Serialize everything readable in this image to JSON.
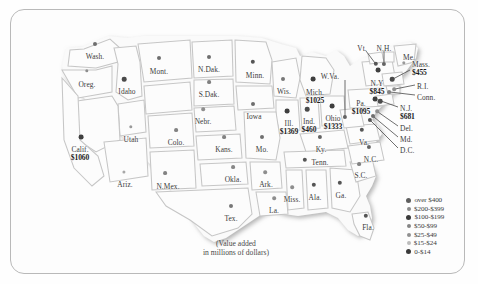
{
  "map": {
    "title": "Value added by manufacture, by state",
    "caption_line1": "(Value added",
    "caption_line2": "in millions of dollars)",
    "bg_color": "#fdfdfd",
    "frame_color": "#b9b9b9",
    "land_color": "#fbfbfb",
    "border_color": "#cfcfcf",
    "shadow_color": "#b3b3b3"
  },
  "states": [
    {
      "name": "Wash.",
      "value": "",
      "x": 95,
      "y": 53,
      "dx": 95,
      "dy": 44,
      "r": 2.0,
      "c": "#6e6e6e",
      "align": "ctr"
    },
    {
      "name": "Oreg.",
      "value": "",
      "x": 87,
      "y": 81,
      "dx": 87,
      "dy": 71,
      "r": 1.7,
      "c": "#8e8e8e",
      "align": "ctr"
    },
    {
      "name": "Idaho",
      "value": "",
      "x": 127,
      "y": 88,
      "dx": 124,
      "dy": 79,
      "r": 2.3,
      "c": "#4a4a4a",
      "align": "ctr"
    },
    {
      "name": "Mont.",
      "value": "",
      "x": 159,
      "y": 68,
      "dx": 159,
      "dy": 58,
      "r": 2.0,
      "c": "#6e6e6e",
      "align": "ctr"
    },
    {
      "name": "N.Dak.",
      "value": "",
      "x": 209,
      "y": 66,
      "dx": 209,
      "dy": 57,
      "r": 2.0,
      "c": "#6e6e6e",
      "align": "ctr"
    },
    {
      "name": "S.Dak.",
      "value": "",
      "x": 209,
      "y": 91,
      "dx": 209,
      "dy": 82,
      "r": 1.9,
      "c": "#808080",
      "align": "ctr"
    },
    {
      "name": "Minn.",
      "value": "",
      "x": 255,
      "y": 72,
      "dx": 253,
      "dy": 62,
      "r": 2.2,
      "c": "#555555",
      "align": "ctr"
    },
    {
      "name": "Wis.",
      "value": "",
      "x": 284,
      "y": 88,
      "dx": 283,
      "dy": 79,
      "r": 2.0,
      "c": "#777777",
      "align": "ctr"
    },
    {
      "name": "Mich.",
      "value": "$1025",
      "x": 315,
      "y": 89,
      "dx": 313,
      "dy": 79,
      "r": 2.4,
      "c": "#3f3f3f",
      "align": "ctr"
    },
    {
      "name": "Nebr.",
      "value": "",
      "x": 203,
      "y": 118,
      "dx": 203,
      "dy": 109,
      "r": 1.8,
      "c": "#8e8e8e",
      "align": "ctr"
    },
    {
      "name": "Iowa",
      "value": "",
      "x": 254,
      "y": 113,
      "dx": 253,
      "dy": 104,
      "r": 2.0,
      "c": "#6e6e6e",
      "align": "ctr"
    },
    {
      "name": "Ill.",
      "value": "$1369",
      "x": 289,
      "y": 120,
      "dx": 287,
      "dy": 111,
      "r": 2.4,
      "c": "#3f3f3f",
      "align": "ctr"
    },
    {
      "name": "Ind.",
      "value": "$460",
      "x": 309,
      "y": 118,
      "dx": 307,
      "dy": 109,
      "r": 2.3,
      "c": "#4a4a4a",
      "align": "ctr"
    },
    {
      "name": "Ohio",
      "value": "$1333",
      "x": 333,
      "y": 115,
      "dx": 332,
      "dy": 106,
      "r": 2.4,
      "c": "#3f3f3f",
      "align": "ctr"
    },
    {
      "name": "Utah",
      "value": "",
      "x": 131,
      "y": 136,
      "dx": 131,
      "dy": 127,
      "r": 1.7,
      "c": "#9a9a9a",
      "align": "ctr"
    },
    {
      "name": "Colo.",
      "value": "",
      "x": 176,
      "y": 139,
      "dx": 176,
      "dy": 130,
      "r": 1.9,
      "c": "#828282",
      "align": "ctr"
    },
    {
      "name": "Calif.",
      "value": "$1060",
      "x": 80,
      "y": 146,
      "dx": 81,
      "dy": 137,
      "r": 2.4,
      "c": "#3f3f3f",
      "align": "ctr"
    },
    {
      "name": "Kans.",
      "value": "",
      "x": 224,
      "y": 146,
      "dx": 224,
      "dy": 137,
      "r": 1.9,
      "c": "#828282",
      "align": "ctr"
    },
    {
      "name": "Mo.",
      "value": "",
      "x": 262,
      "y": 146,
      "dx": 262,
      "dy": 137,
      "r": 2.0,
      "c": "#707070",
      "align": "ctr"
    },
    {
      "name": "Ky.",
      "value": "",
      "x": 321,
      "y": 146,
      "dx": 320,
      "dy": 137,
      "r": 2.1,
      "c": "#636363",
      "align": "ctr"
    },
    {
      "name": "Ariz.",
      "value": "",
      "x": 125,
      "y": 181,
      "dx": 124,
      "dy": 172,
      "r": 1.6,
      "c": "#a8a8a8",
      "align": "ctr"
    },
    {
      "name": "N.Mex.",
      "value": "",
      "x": 168,
      "y": 183,
      "dx": 165,
      "dy": 173,
      "r": 1.9,
      "c": "#828282",
      "align": "ctr"
    },
    {
      "name": "Okla.",
      "value": "",
      "x": 233,
      "y": 176,
      "dx": 233,
      "dy": 167,
      "r": 1.9,
      "c": "#878787",
      "align": "ctr"
    },
    {
      "name": "Ark.",
      "value": "",
      "x": 266,
      "y": 181,
      "dx": 265,
      "dy": 172,
      "r": 1.8,
      "c": "#8e8e8e",
      "align": "ctr"
    },
    {
      "name": "Tenn.",
      "value": "",
      "x": 320,
      "y": 159,
      "dx": 305,
      "dy": 160,
      "r": 2.2,
      "c": "#555555",
      "align": "ctr"
    },
    {
      "name": "Miss.",
      "value": "",
      "x": 292,
      "y": 196,
      "dx": 292,
      "dy": 187,
      "r": 1.8,
      "c": "#8e8e8e",
      "align": "ctr"
    },
    {
      "name": "Ala.",
      "value": "",
      "x": 315,
      "y": 194,
      "dx": 314,
      "dy": 185,
      "r": 2.2,
      "c": "#555555",
      "align": "ctr"
    },
    {
      "name": "Ga.",
      "value": "",
      "x": 341,
      "y": 192,
      "dx": 340,
      "dy": 183,
      "r": 2.2,
      "c": "#555555",
      "align": "ctr"
    },
    {
      "name": "La.",
      "value": "",
      "x": 274,
      "y": 207,
      "dx": 274,
      "dy": 198,
      "r": 1.8,
      "c": "#8e8e8e",
      "align": "ctr"
    },
    {
      "name": "Tex.",
      "value": "",
      "x": 231,
      "y": 215,
      "dx": 231,
      "dy": 206,
      "r": 2.0,
      "c": "#777777",
      "align": "ctr"
    },
    {
      "name": "Fla.",
      "value": "",
      "x": 368,
      "y": 224,
      "dx": 366,
      "dy": 216,
      "r": 2.2,
      "c": "#555555",
      "align": "ctr"
    },
    {
      "name": "N.C.",
      "value": "",
      "x": 371,
      "y": 156,
      "dx": 369,
      "dy": 147,
      "r": 2.1,
      "c": "#636363",
      "align": "ctr"
    },
    {
      "name": "S.C.",
      "value": "",
      "x": 361,
      "y": 172,
      "dx": 359,
      "dy": 164,
      "r": 1.9,
      "c": "#828282",
      "align": "ctr"
    },
    {
      "name": "Va.",
      "value": "",
      "x": 364,
      "y": 139,
      "dx": 362,
      "dy": 130,
      "r": 2.2,
      "c": "#555555",
      "align": "ctr"
    },
    {
      "name": "Pa.",
      "value": "$1095",
      "x": 361,
      "y": 100,
      "dx": 375,
      "dy": 99,
      "r": 2.4,
      "c": "#3f3f3f",
      "align": "ctr"
    },
    {
      "name": "N.Y",
      "value": "$845",
      "x": 377,
      "y": 80,
      "dx": 378,
      "dy": 70,
      "r": 2.4,
      "c": "#3f3f3f",
      "align": "ctr"
    }
  ],
  "callouts": [
    {
      "name": "W.Va.",
      "value": "",
      "tx": 330,
      "ty": 73,
      "dx": 345,
      "dy": 117,
      "r": 2.1,
      "c": "#636363",
      "align": "ctr",
      "line": [
        345,
        80,
        345,
        117
      ]
    },
    {
      "name": "Vt.",
      "value": "",
      "tx": 362,
      "ty": 45,
      "dx": 376,
      "dy": 64,
      "r": 2.2,
      "c": "#555555",
      "align": "ctr",
      "line": [
        366,
        51,
        375,
        63
      ]
    },
    {
      "name": "N.H.",
      "value": "",
      "tx": 384,
      "ty": 45,
      "dx": 384,
      "dy": 64,
      "r": 2.1,
      "c": "#636363",
      "align": "ctr",
      "line": [
        384,
        51,
        384,
        62
      ]
    },
    {
      "name": "Me.",
      "value": "",
      "tx": 409,
      "ty": 54,
      "dx": 404,
      "dy": 63,
      "r": 1.7,
      "c": "#999999",
      "align": "ctr",
      "line": null
    },
    {
      "name": "Mass.",
      "value": "$455",
      "tx": 412,
      "ty": 61,
      "dx": 392,
      "dy": 79,
      "r": 2.3,
      "c": "#4a4a4a",
      "align": "lft",
      "line": [
        410,
        70,
        393,
        79
      ]
    },
    {
      "name": "R.I.",
      "value": "",
      "tx": 417,
      "ty": 83,
      "dx": 394,
      "dy": 89,
      "r": 1.8,
      "c": "#8e8e8e",
      "align": "lft",
      "line": [
        415,
        85,
        395,
        89
      ]
    },
    {
      "name": "Conn.",
      "value": "",
      "tx": 417,
      "ty": 94,
      "dx": 389,
      "dy": 92,
      "r": 1.9,
      "c": "#828282",
      "align": "lft",
      "line": [
        415,
        95,
        390,
        92
      ]
    },
    {
      "name": "N.J.",
      "value": "$681",
      "tx": 400,
      "ty": 105,
      "dx": 380,
      "dy": 101,
      "r": 2.3,
      "c": "#4a4a4a",
      "align": "lft",
      "line": [
        398,
        107,
        381,
        101
      ]
    },
    {
      "name": "Del.",
      "value": "",
      "tx": 400,
      "ty": 125,
      "dx": 377,
      "dy": 111,
      "r": 1.8,
      "c": "#8e8e8e",
      "align": "lft",
      "line": [
        398,
        126,
        378,
        112
      ]
    },
    {
      "name": "Md.",
      "value": "",
      "tx": 400,
      "ty": 136,
      "dx": 373,
      "dy": 116,
      "r": 2.0,
      "c": "#6e6e6e",
      "align": "lft",
      "line": [
        398,
        137,
        374,
        117
      ]
    },
    {
      "name": "D.C.",
      "value": "",
      "tx": 400,
      "ty": 147,
      "dx": 370,
      "dy": 120,
      "r": 2.1,
      "c": "#555555",
      "align": "lft",
      "line": [
        398,
        148,
        371,
        121
      ]
    }
  ],
  "legend": {
    "items": [
      {
        "label": "over $400",
        "r": 2.6,
        "color": "#5e5e5e"
      },
      {
        "label": "$200-$399",
        "r": 2.3,
        "color": "#8a8a8a"
      },
      {
        "label": "$100-$199",
        "r": 2.6,
        "color": "#3a3a3a"
      },
      {
        "label": "$50-$99",
        "r": 2.2,
        "color": "#858585"
      },
      {
        "label": "$25-$49",
        "r": 2.1,
        "color": "#909090"
      },
      {
        "label": "$15-$24",
        "r": 1.9,
        "color": "#bcbcbc"
      },
      {
        "label": "0-$14",
        "r": 2.5,
        "color": "#3a3a3a"
      }
    ]
  }
}
